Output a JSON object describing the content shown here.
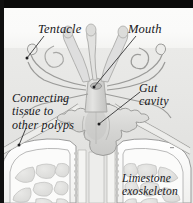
{
  "figure": {
    "style": "grayscale scientific illustration, italic serif labels with leader lines",
    "width": 193,
    "height": 203,
    "colors": {
      "frame_black": "#0a0a0a",
      "water_upper": "#fbfbfa",
      "water_lower": "#e8e8e6",
      "skeleton_light": "#fdfdfc",
      "tissue_gray": "#d2d2d0",
      "outline_gray": "#8d8d8d",
      "label_text": "#17171a"
    }
  },
  "labels": {
    "tentacle": "Tentacle",
    "mouth": "Mouth",
    "gut_cavity": "Gut\ncavity",
    "connecting_tissue": "Connecting\ntissue to\nother polyps",
    "limestone": "Limestone\nexoskeleton"
  },
  "anatomy": {
    "parts": [
      {
        "name": "tentacle",
        "description": "club-tipped arms radiating from oral disc"
      },
      {
        "name": "mouth",
        "description": "central opening at top of column"
      },
      {
        "name": "gut-cavity",
        "description": "lobed internal digestive chamber"
      },
      {
        "name": "connecting-tissue",
        "description": "coenosarc sheet linking neighbouring polyps"
      },
      {
        "name": "limestone-exoskeleton",
        "description": "calcium carbonate corallite cup with chambered texture"
      }
    ],
    "tentacle_count": 8
  }
}
